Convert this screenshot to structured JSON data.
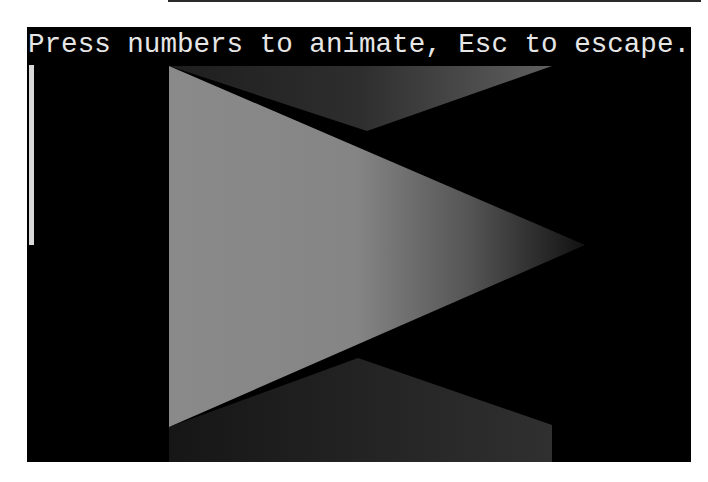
{
  "window": {
    "background": "#000000",
    "frame_color": "#ffffff"
  },
  "terminal": {
    "prompt_text": "Press numbers to animate, Esc to escape.",
    "text_color": "#e6e6e6",
    "cursor": "vertical-bar"
  },
  "scene": {
    "shapes": [
      {
        "name": "main-triangle",
        "points": [
          [
            142,
            39
          ],
          [
            558,
            218
          ],
          [
            142,
            400
          ]
        ],
        "gradient": [
          "#8a8a8a",
          "#888888",
          "#1a1a1a"
        ]
      },
      {
        "name": "top-back-triangle",
        "points": [
          [
            142,
            39
          ],
          [
            525,
            39
          ],
          [
            340,
            104
          ]
        ],
        "gradient": [
          "#1c1c1c",
          "#5e5e5e"
        ]
      },
      {
        "name": "bottom-back-quad",
        "points": [
          [
            142,
            400
          ],
          [
            331,
            331
          ],
          [
            525,
            398
          ],
          [
            525,
            435
          ],
          [
            142,
            435
          ]
        ],
        "gradient": [
          "#1a1a1a",
          "#2e2e2e"
        ]
      }
    ]
  }
}
